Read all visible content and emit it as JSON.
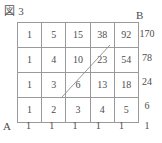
{
  "figure": {
    "title": "図 3",
    "vertex_start_label": "A",
    "vertex_end_label": "B"
  },
  "chart_data": {
    "type": "table",
    "title": "図 3",
    "xlabel": "",
    "ylabel": "",
    "categories": [
      "c1",
      "c2",
      "c3",
      "c4",
      "c5"
    ],
    "rows": [
      {
        "name": "row1",
        "values": [
          1,
          5,
          15,
          38,
          92
        ],
        "total": 170
      },
      {
        "name": "row2",
        "values": [
          1,
          4,
          10,
          23,
          54
        ],
        "total": 78
      },
      {
        "name": "row3",
        "values": [
          1,
          3,
          6,
          13,
          18
        ],
        "total": 24
      },
      {
        "name": "row4",
        "values": [
          1,
          2,
          3,
          4,
          5
        ],
        "total": 6
      }
    ],
    "column_footers": [
      1,
      1,
      1,
      1,
      1
    ],
    "corner_footer": 1,
    "grid": true,
    "legend": "none"
  },
  "grid": {
    "cells": [
      [
        "1",
        "5",
        "15",
        "38",
        "92"
      ],
      [
        "1",
        "4",
        "10",
        "23",
        "54"
      ],
      [
        "1",
        "3",
        "6",
        "13",
        "18"
      ],
      [
        "1",
        "2",
        "3",
        "4",
        "5"
      ]
    ],
    "row_totals": [
      "170",
      "78",
      "24",
      "6"
    ],
    "column_footers": [
      "1",
      "1",
      "1",
      "1",
      "1"
    ],
    "corner_footer": "1"
  },
  "path": {
    "stroke_color": "#8c8c8c",
    "start_x": 62,
    "start_y": 97,
    "end_x": 110,
    "end_y": 45
  },
  "colors": {
    "grid_line": "#9a9a9a",
    "text": "#4d4d4d",
    "background": "#ffffff"
  }
}
